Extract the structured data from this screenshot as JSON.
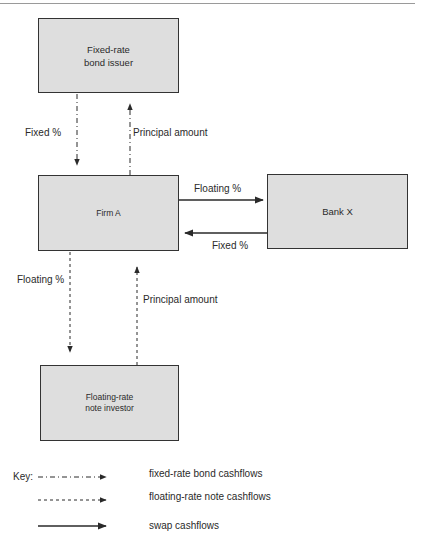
{
  "diagram": {
    "nodes": {
      "bond_issuer": {
        "line1": "Fixed-rate",
        "line2": "bond issuer"
      },
      "firm_a": {
        "label": "Firm A"
      },
      "bank_x": {
        "label": "Bank X"
      },
      "frn_investor": {
        "line1": "Floating-rate",
        "line2": "note investor"
      }
    },
    "edges": {
      "issuer_to_firm_fixed": {
        "label": "Fixed %",
        "style": "dash-dot"
      },
      "firm_to_issuer_principal": {
        "label": "Principal amount",
        "style": "dash-dot"
      },
      "firm_to_bank_floating": {
        "label": "Floating %",
        "style": "solid"
      },
      "bank_to_firm_fixed": {
        "label": "Fixed %",
        "style": "solid"
      },
      "firm_to_investor_floating": {
        "label": "Floating %",
        "style": "dashed"
      },
      "investor_to_firm_principal": {
        "label": "Principal amount",
        "style": "dashed"
      }
    },
    "key": {
      "title": "Key:",
      "items": [
        {
          "style": "dash-dot",
          "label": "fixed-rate bond cashflows"
        },
        {
          "style": "dashed",
          "label": "floating-rate note cashflows"
        },
        {
          "style": "solid",
          "label": "swap cashflows"
        }
      ]
    },
    "colors": {
      "box_fill": "#dedede",
      "box_border": "#333333",
      "line": "#2a2a2a"
    }
  }
}
